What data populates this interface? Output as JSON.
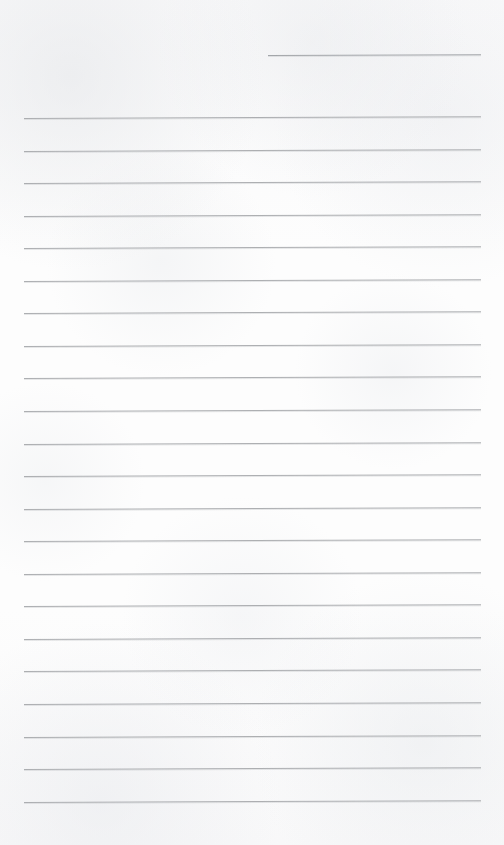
{
  "document": {
    "kind": "scanned-lined-paper",
    "title": "Blank Ruled Notepad Page",
    "width_px": 504,
    "height_px": 845,
    "background_color": "#fdfdfd",
    "rule_color": "#a9abae",
    "content_text": "",
    "handwriting_present": "no"
  },
  "header_rule": {
    "name": "header-entry-rule",
    "x_start_px": 268,
    "x_end_px": 481,
    "y_px": 55,
    "skew_deg": -0.22,
    "color": "#9fa2a6"
  },
  "body_rules": {
    "count": 22,
    "x_start_px": 24,
    "x_end_px": 481,
    "first_y_px": 118,
    "spacing_px": 32.55,
    "skew_deg": -0.22,
    "color": "#a9abae",
    "lines": [
      {
        "index": 1,
        "y_px": 118.0
      },
      {
        "index": 2,
        "y_px": 150.6
      },
      {
        "index": 3,
        "y_px": 183.1
      },
      {
        "index": 4,
        "y_px": 215.7
      },
      {
        "index": 5,
        "y_px": 248.2
      },
      {
        "index": 6,
        "y_px": 280.8
      },
      {
        "index": 7,
        "y_px": 313.3
      },
      {
        "index": 8,
        "y_px": 345.9
      },
      {
        "index": 9,
        "y_px": 378.4
      },
      {
        "index": 10,
        "y_px": 411.0
      },
      {
        "index": 11,
        "y_px": 443.5
      },
      {
        "index": 12,
        "y_px": 476.1
      },
      {
        "index": 13,
        "y_px": 508.6
      },
      {
        "index": 14,
        "y_px": 541.2
      },
      {
        "index": 15,
        "y_px": 573.7
      },
      {
        "index": 16,
        "y_px": 606.3
      },
      {
        "index": 17,
        "y_px": 638.8
      },
      {
        "index": 18,
        "y_px": 671.4
      },
      {
        "index": 19,
        "y_px": 703.9
      },
      {
        "index": 20,
        "y_px": 736.5
      },
      {
        "index": 21,
        "y_px": 769.0
      },
      {
        "index": 22,
        "y_px": 801.6
      }
    ]
  }
}
